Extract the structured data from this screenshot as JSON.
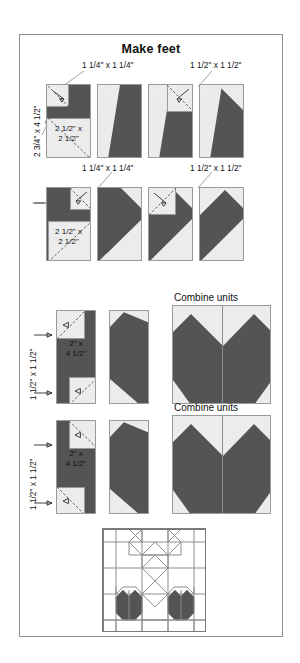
{
  "document": {
    "title": "Make feet",
    "type": "quilt-block-piecing-diagram"
  },
  "colors": {
    "dark_fabric": "#545454",
    "light_fabric": "#ececec",
    "background": "#ffffff",
    "outline": "#9a9a9a",
    "frame": "#8d8d8d",
    "dashed_sewline": "#555555"
  },
  "rows": [
    {
      "id": "row-1",
      "name": "left-foot-strip",
      "labels": {
        "top_left": "1 1/4\" x 1 1/4\"",
        "top_right": "1 1/2\" x 1 1/2\"",
        "vertical": "2 3/4\" x 4 1/2\"",
        "inner": "2 1/2\" x\n2 1/2\""
      },
      "steps": 4
    },
    {
      "id": "row-2",
      "name": "right-foot-strip",
      "labels": {
        "top_left": "1 1/4\" x 1 1/4\"",
        "top_right": "1 1/2\" x 1 1/2\"",
        "vertical": "2 3/4\" x 4 1/2\"",
        "inner": "2 1/2\" x\n2 1/2\""
      },
      "steps": 4
    },
    {
      "id": "row-3",
      "name": "left-inner-leg",
      "labels": {
        "vertical_top": "1 1/2\" x 1 1/2\"",
        "vertical_bottom": "1 1/2\" x 1 1/2\"",
        "inner": "2\" x\n4 1/2\"",
        "combine": "Combine units"
      },
      "steps": 2
    },
    {
      "id": "row-4",
      "name": "right-inner-leg",
      "labels": {
        "vertical_top": "1 1/2\" x 1 1/2\"",
        "vertical_bottom": "1 1/2\" x 1 1/2\"",
        "inner": "2\" x\n4 1/2\"",
        "combine": "Combine units"
      },
      "steps": 2
    }
  ],
  "labels": {
    "r1_top_left": "1 1/4\" x 1 1/4\"",
    "r1_top_right": "1 1/2\" x 1 1/2\"",
    "r1_vertical": "2 3/4\" x 4 1/2\"",
    "r1_inner_a": "2 1/2\" x",
    "r1_inner_b": "2 1/2\"",
    "r2_top_left": "1 1/4\" x 1 1/4\"",
    "r2_top_right": "1 1/2\" x 1 1/2\"",
    "r2_inner_a": "2 1/2\" x",
    "r2_inner_b": "2 1/2\"",
    "r3_vertical": "1 1/2\" x 1 1/2\"",
    "r3_inner_a": "2\" x",
    "r3_inner_b": "4 1/2\"",
    "r3_combine": "Combine units",
    "r4_vertical": "1 1/2\" x 1 1/2\"",
    "r4_inner_a": "2\" x",
    "r4_inner_b": "4 1/2\"",
    "r4_combine": "Combine units"
  },
  "final_block": {
    "name": "completed-quilt-block",
    "description": "Pieced sampler block with two dark heart/foot units along the bottom"
  }
}
